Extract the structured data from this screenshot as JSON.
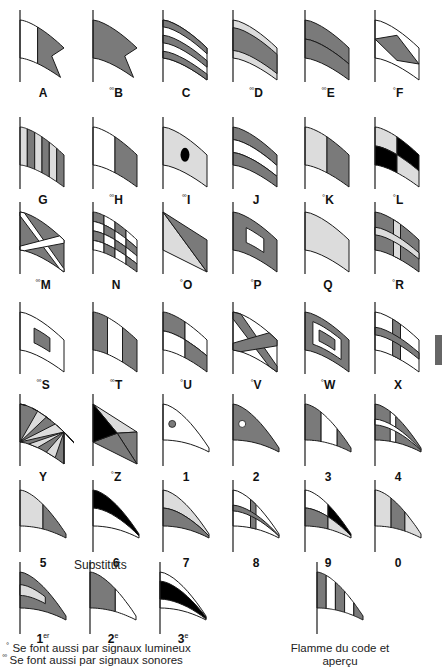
{
  "colors": {
    "dark": "#7a7a7a",
    "light": "#dcdcdc",
    "white": "#ffffff",
    "black": "#000000",
    "stroke": "#1a1a1a",
    "tab": "#666666"
  },
  "legend": {
    "lumineux_marker": "°",
    "lumineux_text": "Se font aussi par signaux lumineux",
    "sonores_marker": "°°",
    "sonores_text": "Se font aussi par signaux sonores"
  },
  "substituts_title": "Substituts",
  "code_pennant_caption_line1": "Flamme du code et",
  "code_pennant_caption_line2": "aperçu",
  "flags": [
    {
      "id": "A",
      "prefix": "",
      "label": "A",
      "type": "swallowtail",
      "pattern": "A"
    },
    {
      "id": "B",
      "prefix": "°°",
      "label": "B",
      "type": "swallowtail",
      "pattern": "B"
    },
    {
      "id": "C",
      "prefix": "",
      "label": "C",
      "type": "rect",
      "pattern": "C"
    },
    {
      "id": "D",
      "prefix": "°°",
      "label": "D",
      "type": "rect",
      "pattern": "D"
    },
    {
      "id": "E",
      "prefix": "°°",
      "label": "E",
      "type": "rect",
      "pattern": "E"
    },
    {
      "id": "F",
      "prefix": "°",
      "label": "F",
      "type": "rect",
      "pattern": "F"
    },
    {
      "id": "G",
      "prefix": "",
      "label": "G",
      "type": "rect",
      "pattern": "G"
    },
    {
      "id": "H",
      "prefix": "°°",
      "label": "H",
      "type": "rect",
      "pattern": "H"
    },
    {
      "id": "I",
      "prefix": "°°",
      "label": "I",
      "type": "rect",
      "pattern": "I"
    },
    {
      "id": "J",
      "prefix": "",
      "label": "J",
      "type": "rect",
      "pattern": "J"
    },
    {
      "id": "K",
      "prefix": "°",
      "label": "K",
      "type": "rect",
      "pattern": "K"
    },
    {
      "id": "L",
      "prefix": "°",
      "label": "L",
      "type": "rect",
      "pattern": "L"
    },
    {
      "id": "M",
      "prefix": "°°",
      "label": "M",
      "type": "rect",
      "pattern": "M"
    },
    {
      "id": "N",
      "prefix": "",
      "label": "N",
      "type": "rect",
      "pattern": "N"
    },
    {
      "id": "O",
      "prefix": "°",
      "label": "O",
      "type": "rect",
      "pattern": "O"
    },
    {
      "id": "P",
      "prefix": "°",
      "label": "P",
      "type": "rect",
      "pattern": "P"
    },
    {
      "id": "Q",
      "prefix": "",
      "label": "Q",
      "type": "rect",
      "pattern": "Q"
    },
    {
      "id": "R",
      "prefix": "°",
      "label": "R",
      "type": "rect",
      "pattern": "R"
    },
    {
      "id": "S",
      "prefix": "°°",
      "label": "S",
      "type": "rect",
      "pattern": "S"
    },
    {
      "id": "T",
      "prefix": "°°",
      "label": "T",
      "type": "rect",
      "pattern": "T"
    },
    {
      "id": "U",
      "prefix": "°",
      "label": "U",
      "type": "rect",
      "pattern": "U"
    },
    {
      "id": "V",
      "prefix": "°",
      "label": "V",
      "type": "rect",
      "pattern": "V"
    },
    {
      "id": "W",
      "prefix": "°",
      "label": "W",
      "type": "rect",
      "pattern": "W"
    },
    {
      "id": "X",
      "prefix": "",
      "label": "X",
      "type": "rect",
      "pattern": "X"
    },
    {
      "id": "Y",
      "prefix": "",
      "label": "Y",
      "type": "rect",
      "pattern": "Y"
    },
    {
      "id": "Z",
      "prefix": "°",
      "label": "Z",
      "type": "rect",
      "pattern": "Z"
    },
    {
      "id": "1",
      "prefix": "",
      "label": "1",
      "type": "pennant",
      "pattern": "P1"
    },
    {
      "id": "2",
      "prefix": "",
      "label": "2",
      "type": "pennant",
      "pattern": "P2"
    },
    {
      "id": "3",
      "prefix": "",
      "label": "3",
      "type": "pennant",
      "pattern": "P3"
    },
    {
      "id": "4",
      "prefix": "",
      "label": "4",
      "type": "pennant",
      "pattern": "P4"
    },
    {
      "id": "5",
      "prefix": "",
      "label": "5",
      "type": "pennant",
      "pattern": "P5"
    },
    {
      "id": "6",
      "prefix": "",
      "label": "6",
      "type": "pennant",
      "pattern": "P6"
    },
    {
      "id": "7",
      "prefix": "",
      "label": "7",
      "type": "pennant",
      "pattern": "P7"
    },
    {
      "id": "8",
      "prefix": "",
      "label": "8",
      "type": "pennant",
      "pattern": "P8"
    },
    {
      "id": "9",
      "prefix": "",
      "label": "9",
      "type": "pennant",
      "pattern": "P9"
    },
    {
      "id": "0",
      "prefix": "",
      "label": "0",
      "type": "pennant",
      "pattern": "P0"
    }
  ],
  "substitutes": [
    {
      "id": "sub1",
      "label": "1",
      "sup": "er",
      "pattern": "S1"
    },
    {
      "id": "sub2",
      "label": "2",
      "sup": "e",
      "pattern": "S2"
    },
    {
      "id": "sub3",
      "label": "3",
      "sup": "e",
      "pattern": "S3"
    }
  ],
  "code_pennant": {
    "id": "code",
    "pattern": "CODE"
  }
}
